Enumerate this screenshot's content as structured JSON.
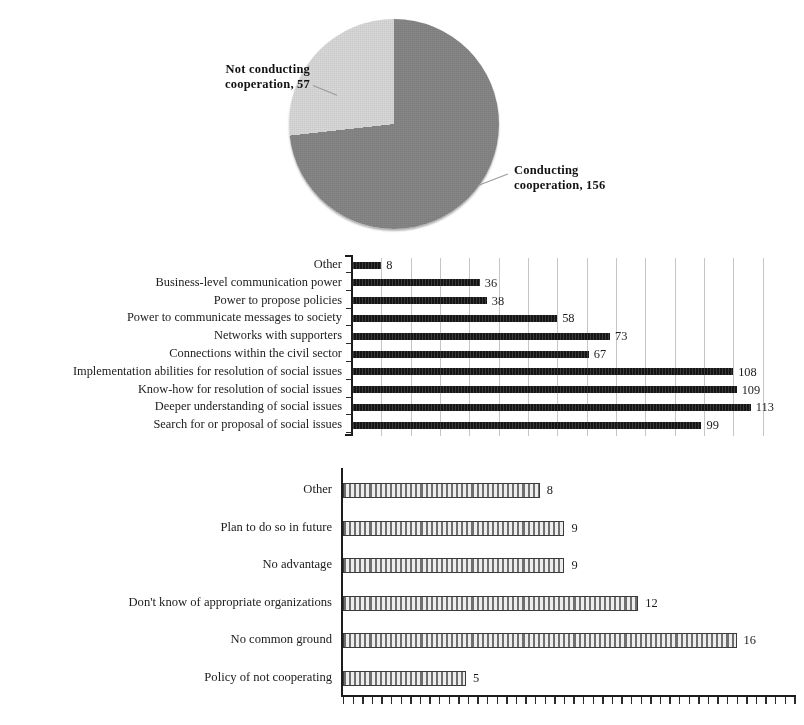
{
  "page": {
    "cut_top_text": ""
  },
  "chart_data": [
    {
      "type": "pie",
      "title": "",
      "labels": [
        "Conducting cooperation",
        "Not conducting cooperation"
      ],
      "values": [
        156,
        57
      ],
      "label_texts": [
        "Conducting\ncooperation, 156",
        "Not conducting\ncooperation, 57"
      ],
      "slices": [
        {
          "name": "Conducting cooperation",
          "value": 156,
          "label": "Conducting cooperation, 156",
          "label_line1": "Conducting",
          "label_line2": "cooperation, 156",
          "color": "#878787",
          "start_deg": 0,
          "end_deg": 263
        },
        {
          "name": "Not conducting cooperation",
          "value": 57,
          "label": "Not conducting cooperation, 57",
          "label_line1": "Not conducting",
          "label_line2": "cooperation, 57",
          "color": "#d9d9d9",
          "start_deg": 263,
          "end_deg": 360
        }
      ],
      "legend_position": "callout-labels",
      "grid": false
    },
    {
      "type": "bar",
      "orientation": "horizontal",
      "title": "",
      "xlabel": "",
      "ylabel": "",
      "grid": true,
      "xlim": [
        0,
        125
      ],
      "bar_color": "#151515",
      "categories": [
        "Other",
        "Business-level communication power",
        "Power to propose policies",
        "Power to communicate messages to society",
        "Networks with supporters",
        "Connections within the civil sector",
        "Implementation abilities for resolution of social issues",
        "Know-how for resolution of social issues",
        "Deeper understanding of social issues",
        "Search for or proposal of social issues"
      ],
      "values": [
        8,
        36,
        38,
        58,
        73,
        67,
        108,
        109,
        113,
        99
      ]
    },
    {
      "type": "bar",
      "orientation": "horizontal",
      "title": "",
      "xlabel": "",
      "ylabel": "",
      "grid": false,
      "xlim": [
        0,
        18.5
      ],
      "bar_color": "#e2e2e2",
      "bar_pattern": "vertical-hatch",
      "categories": [
        "Other",
        "Plan to do so in future",
        "No advantage",
        "Don't know of appropriate organizations",
        "No common ground",
        "Policy of not cooperating"
      ],
      "values": [
        8,
        9,
        9,
        12,
        16,
        5
      ]
    }
  ]
}
